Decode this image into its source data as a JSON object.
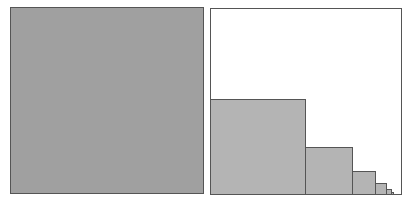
{
  "diagram": {
    "colors": {
      "left_fill": "#a0a0a0",
      "bar_fill": "#b4b4b4",
      "border": "#555555",
      "background": "#ffffff"
    },
    "right_squares": [
      {
        "size": 96
      },
      {
        "size": 48
      },
      {
        "size": 24
      },
      {
        "size": 12
      },
      {
        "size": 6
      },
      {
        "size": 3
      }
    ]
  }
}
